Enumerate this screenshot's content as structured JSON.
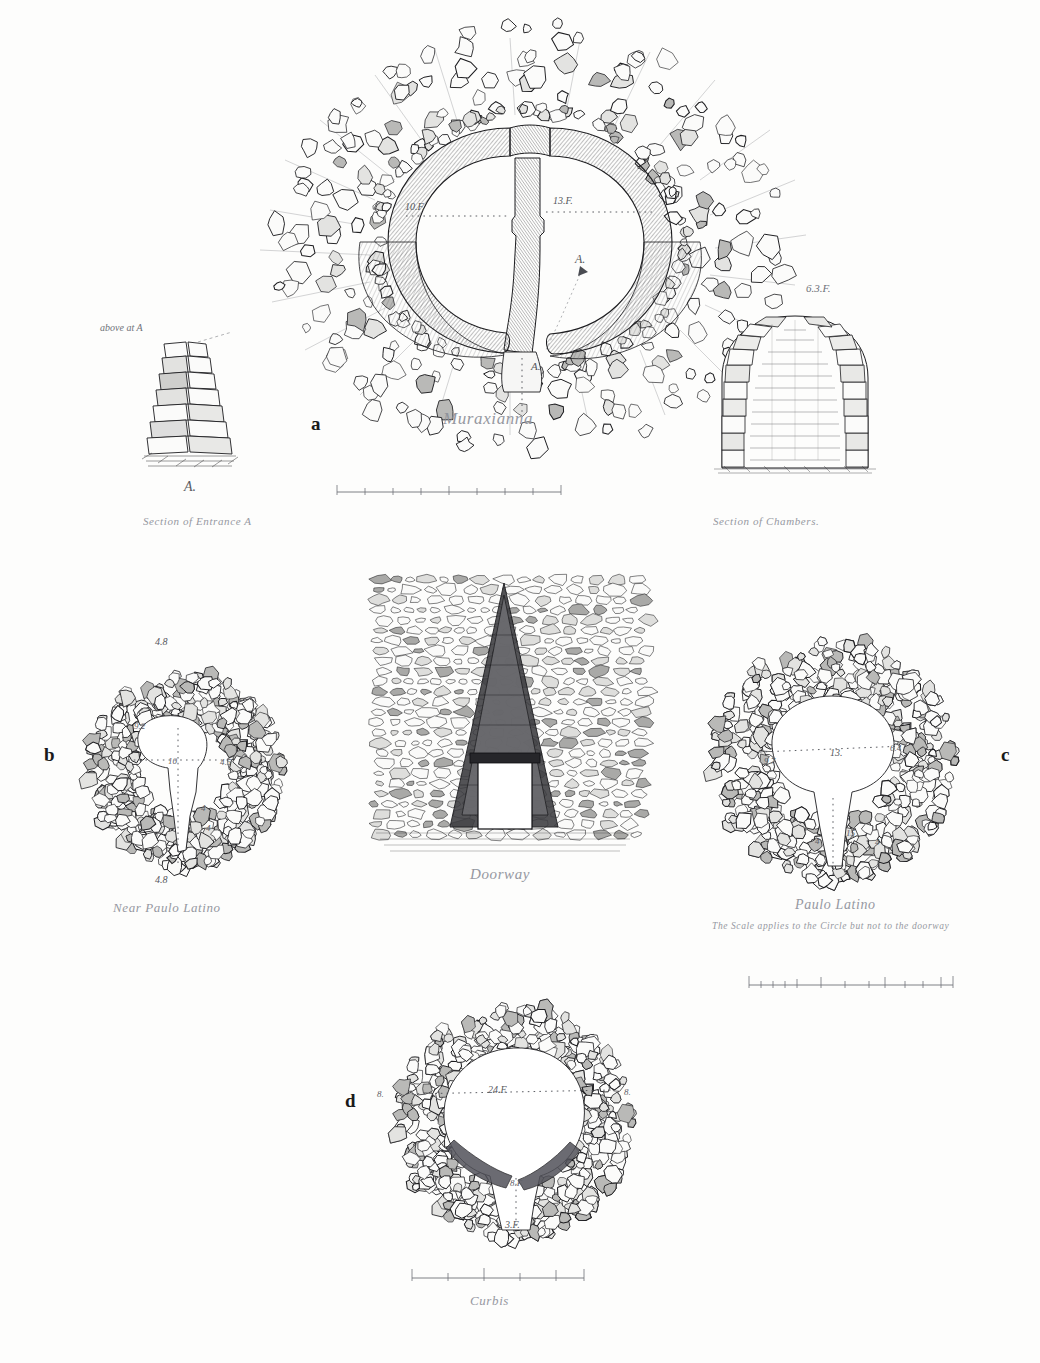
{
  "plate": {
    "title": "Plate of Nuraghe Plans and Sections",
    "background_color": "#fdfdfc",
    "ink_color": "#1d1d20"
  },
  "panels": [
    {
      "id": "a",
      "letter": "a",
      "letter_pos": {
        "x": 311,
        "y": 413
      },
      "main_caption": "Muraxianna",
      "main_caption_pos": {
        "x": 443,
        "y": 409
      },
      "figure_type": "double-chamber-plan",
      "measurements": [
        {
          "label": "10.F.",
          "x": 405,
          "y": 201
        },
        {
          "label": "13.F.",
          "x": 553,
          "y": 195
        },
        {
          "label": "A.",
          "x": 575,
          "y": 255
        },
        {
          "label": "A.",
          "x": 531,
          "y": 363
        }
      ],
      "sub_figures": [
        {
          "id": "section-entrance-a",
          "caption": "Section of Entrance A",
          "caption_pos": {
            "x": 143,
            "y": 519
          },
          "note_label": "above at A",
          "note_pos": {
            "x": 100,
            "y": 328
          },
          "mark_label": "A.",
          "mark_pos": {
            "x": 190,
            "y": 487
          }
        },
        {
          "id": "section-of-chambers",
          "caption": "Section of Chambers.",
          "caption_pos": {
            "x": 713,
            "y": 519
          },
          "note_label": "6.3.F.",
          "note_pos": {
            "x": 806,
            "y": 287
          }
        }
      ],
      "scale_bar": {
        "x": 335,
        "y": 489,
        "width": 225,
        "label": ""
      }
    },
    {
      "id": "b",
      "letter": "b",
      "letter_pos": {
        "x": 47,
        "y": 752
      },
      "main_caption": "Near Paulo Latino",
      "main_caption_pos": {
        "x": 113,
        "y": 904
      },
      "figure_type": "circle-plan",
      "measurements": [
        {
          "label": "4.8",
          "x": 160,
          "y": 641
        },
        {
          "label": "9.2",
          "x": 140,
          "y": 726
        },
        {
          "label": "10",
          "x": 172,
          "y": 761
        },
        {
          "label": "4.5",
          "x": 223,
          "y": 762
        },
        {
          "label": "4",
          "x": 203,
          "y": 808
        },
        {
          "label": "4",
          "x": 208,
          "y": 828
        },
        {
          "label": "4.8",
          "x": 160,
          "y": 879
        }
      ]
    },
    {
      "id": "doorway",
      "letter": "",
      "main_caption": "Doorway",
      "main_caption_pos": {
        "x": 470,
        "y": 869
      },
      "figure_type": "doorway-elevation"
    },
    {
      "id": "c",
      "letter": "c",
      "letter_pos": {
        "x": 1003,
        "y": 752
      },
      "main_caption": "Paulo Latino",
      "main_caption_pos": {
        "x": 795,
        "y": 901
      },
      "sub_caption": "The Scale applies to the Circle but not to the doorway",
      "sub_caption_pos": {
        "x": 712,
        "y": 925
      },
      "figure_type": "circle-plan",
      "measurements": [
        {
          "label": "9.7",
          "x": 768,
          "y": 761
        },
        {
          "label": "13.",
          "x": 833,
          "y": 752
        },
        {
          "label": "6.4",
          "x": 893,
          "y": 748
        },
        {
          "label": "15",
          "x": 849,
          "y": 832
        },
        {
          "label": "4",
          "x": 817,
          "y": 840
        },
        {
          "label": "4",
          "x": 877,
          "y": 841
        }
      ],
      "scale_bar": {
        "x": 745,
        "y": 978,
        "width": 210
      }
    },
    {
      "id": "d",
      "letter": "d",
      "letter_pos": {
        "x": 348,
        "y": 1098
      },
      "main_caption": "Curbis",
      "main_caption_pos": {
        "x": 470,
        "y": 1297
      },
      "figure_type": "circle-plan",
      "measurements": [
        {
          "label": "8.",
          "x": 380,
          "y": 1094
        },
        {
          "label": "24.F.",
          "x": 492,
          "y": 1090
        },
        {
          "label": "8.",
          "x": 627,
          "y": 1092
        },
        {
          "label": "8.F.",
          "x": 513,
          "y": 1183
        },
        {
          "label": "3.F.",
          "x": 508,
          "y": 1224
        }
      ],
      "scale_bar": {
        "x": 408,
        "y": 1272,
        "width": 175
      }
    }
  ]
}
